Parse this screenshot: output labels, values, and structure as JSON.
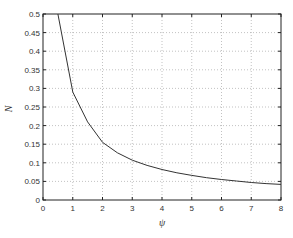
{
  "chart_data": {
    "type": "line",
    "title": "",
    "xlabel": "ψ",
    "ylabel": "N",
    "xlim": [
      0,
      8
    ],
    "ylim": [
      0,
      0.5
    ],
    "grid": true,
    "legend": null,
    "x_ticks": [
      "0",
      "1",
      "2",
      "3",
      "4",
      "5",
      "6",
      "7",
      "8"
    ],
    "y_ticks": [
      "0",
      "0.05",
      "0.1",
      "0.15",
      "0.2",
      "0.25",
      "0.3",
      "0.35",
      "0.4",
      "0.45",
      "0.5"
    ],
    "series": [
      {
        "name": "N(ψ)",
        "x": [
          0.5,
          1,
          1.5,
          2,
          2.5,
          3,
          3.5,
          4,
          4.5,
          5,
          5.5,
          6,
          6.5,
          7,
          7.5,
          8
        ],
        "values": [
          0.5,
          0.29,
          0.21,
          0.155,
          0.127,
          0.107,
          0.093,
          0.082,
          0.073,
          0.066,
          0.06,
          0.055,
          0.051,
          0.047,
          0.044,
          0.042
        ]
      }
    ]
  }
}
